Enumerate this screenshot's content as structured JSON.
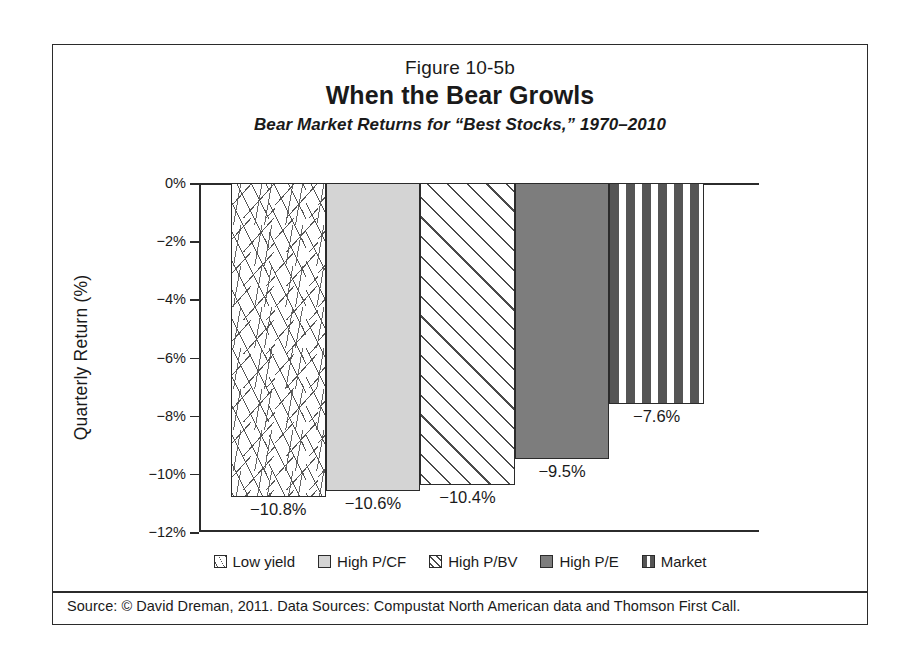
{
  "figure": {
    "number": "Figure 10-5b",
    "title": "When the Bear Growls",
    "subtitle": "Bear Market Returns for “Best Stocks,” 1970–2010",
    "source_note": "Source: © David Dreman, 2011. Data Sources: Compustat North American data and Thomson First Call."
  },
  "chart_data": {
    "type": "bar",
    "title": "When the Bear Growls",
    "subtitle": "Bear Market Returns for “Best Stocks,” 1970–2010",
    "xlabel": "",
    "ylabel": "Quarterly Return (%)",
    "ylim": [
      -12,
      0
    ],
    "yticks": [
      "0%",
      "−2%",
      "−4%",
      "−6%",
      "−8%",
      "−10%",
      "−12%"
    ],
    "ytick_values": [
      0,
      -2,
      -4,
      -6,
      -8,
      -10,
      -12
    ],
    "grid": false,
    "legend_position": "bottom",
    "categories": [
      "Low yield",
      "High P/CF",
      "High P/BV",
      "High P/E",
      "Market"
    ],
    "values": [
      -10.8,
      -10.6,
      -10.4,
      -9.5,
      -7.6
    ],
    "labels": [
      "−10.8%",
      "−10.6%",
      "−10.4%",
      "−9.5%",
      "−7.6%"
    ],
    "series": [
      {
        "name": "Bear Market Quarterly Return",
        "values": [
          -10.8,
          -10.6,
          -10.4,
          -9.5,
          -7.6
        ]
      }
    ],
    "bars": [
      {
        "category": "Low yield",
        "value": -10.8,
        "label": "−10.8%",
        "fill": "scattered-dashes"
      },
      {
        "category": "High P/CF",
        "value": -10.6,
        "label": "−10.6%",
        "fill": "solid-light-gray"
      },
      {
        "category": "High P/BV",
        "value": -10.4,
        "label": "−10.4%",
        "fill": "diagonal-hatch"
      },
      {
        "category": "High P/E",
        "value": -9.5,
        "label": "−9.5%",
        "fill": "solid-dark-gray"
      },
      {
        "category": "Market",
        "value": -7.6,
        "label": "−7.6%",
        "fill": "horizontal-dashes"
      }
    ],
    "legend": [
      {
        "label": "Low yield",
        "fill": "scattered-dashes"
      },
      {
        "label": "High P/CF",
        "fill": "solid-light-gray"
      },
      {
        "label": "High P/BV",
        "fill": "diagonal-hatch"
      },
      {
        "label": "High P/E",
        "fill": "solid-dark-gray"
      },
      {
        "label": "Market",
        "fill": "horizontal-dashes"
      }
    ],
    "colors": {
      "axis": "#2b2b2b",
      "text": "#1a1a1a",
      "light_gray_fill": "#d4d4d4",
      "dark_gray_fill": "#7d7d7d",
      "hatch": "#4a4a4a",
      "background": "#ffffff"
    }
  }
}
